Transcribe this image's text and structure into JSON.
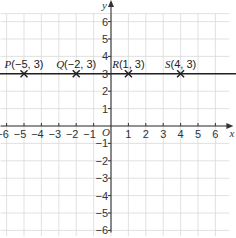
{
  "chart_data": {
    "type": "scatter",
    "title": "",
    "xlabel": "x",
    "ylabel": "y",
    "origin_label": "O",
    "xlim": [
      -6,
      6
    ],
    "ylim": [
      -6,
      6
    ],
    "grid": true,
    "x_ticks": [
      -6,
      -5,
      -4,
      -3,
      -2,
      -1,
      1,
      2,
      3,
      4,
      5,
      6
    ],
    "y_ticks": [
      -6,
      -5,
      -4,
      -3,
      -2,
      -1,
      1,
      2,
      3,
      4,
      5,
      6
    ],
    "points": [
      {
        "name": "P",
        "x": -5,
        "y": 3,
        "label": "P(−5, 3)"
      },
      {
        "name": "Q",
        "x": -2,
        "y": 3,
        "label": "Q(−2, 3)"
      },
      {
        "name": "R",
        "x": 1,
        "y": 3,
        "label": "R(1, 3)"
      },
      {
        "name": "S",
        "x": 4,
        "y": 3,
        "label": "S(4, 3)"
      }
    ],
    "lines": [
      {
        "equation": "y = 3",
        "type": "horizontal",
        "y": 3
      }
    ],
    "colors": {
      "grid": "#d9d9d9",
      "axis": "#333333",
      "line": "#222222",
      "marker": "#222222"
    }
  }
}
